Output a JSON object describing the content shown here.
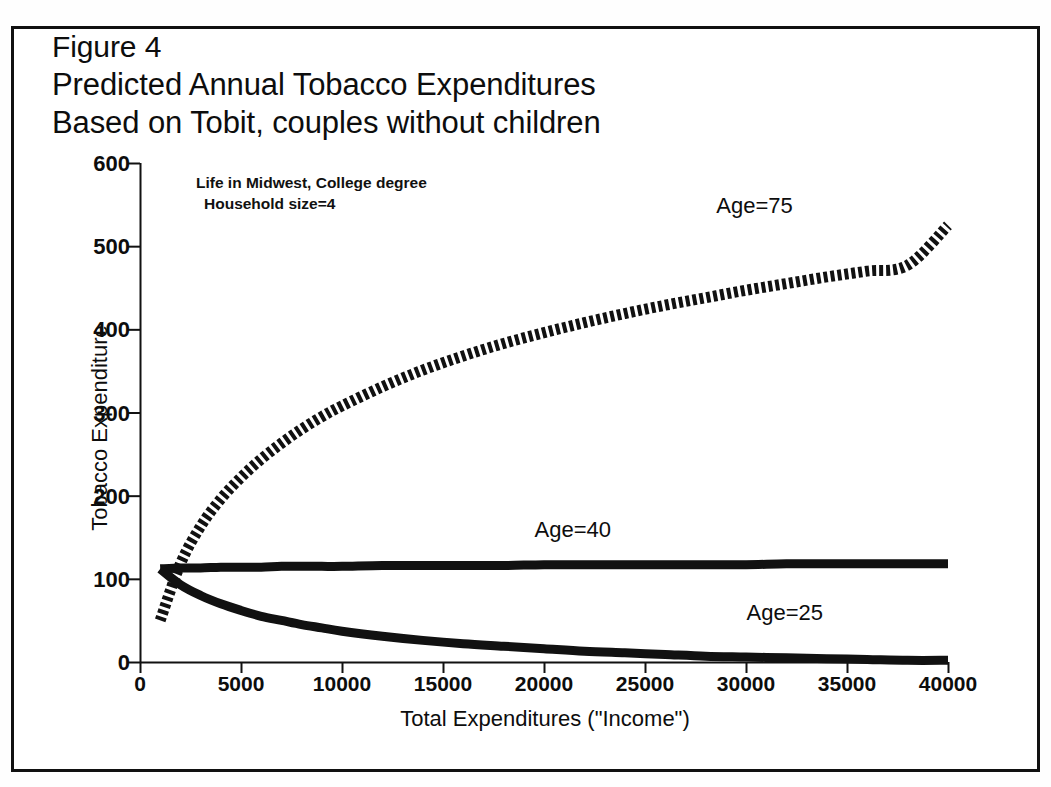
{
  "figure": {
    "title_lines": [
      "Figure 4",
      "Predicted Annual Tobacco Expenditures",
      "Based on Tobit, couples without children"
    ],
    "annotation_lines": [
      "Life in Midwest, College degree",
      "Household size=4"
    ]
  },
  "chart_data": {
    "type": "line",
    "title": "Predicted Annual Tobacco Expenditures Based on Tobit, couples without children",
    "subtitle": "Figure 4",
    "xlabel": "Total Expenditures (\"Income\")",
    "ylabel": "Tobacco Expenditure",
    "xlim": [
      0,
      40000
    ],
    "ylim": [
      0,
      600
    ],
    "xticks": [
      0,
      5000,
      10000,
      15000,
      20000,
      25000,
      30000,
      35000,
      40000
    ],
    "xtick_labels": [
      "0",
      "5000",
      "10000",
      "15000",
      "20000",
      "25000",
      "30000",
      "35000",
      "40000"
    ],
    "yticks": [
      0,
      100,
      200,
      300,
      400,
      500,
      600
    ],
    "ytick_labels": [
      "0",
      "100",
      "200",
      "300",
      "400",
      "500",
      "600"
    ],
    "grid": false,
    "legend_position": "inline-annotation",
    "annotations": [
      "Life in Midwest, College degree",
      "Household size=4"
    ],
    "x": [
      1000,
      2000,
      3000,
      4000,
      5000,
      6000,
      7000,
      8000,
      9000,
      10000,
      12000,
      14000,
      16000,
      18000,
      20000,
      22000,
      24000,
      26000,
      28000,
      30000,
      32000,
      34000,
      36000,
      38000,
      40000
    ],
    "series": [
      {
        "name": "Age=75",
        "label": "Age=75",
        "style": "dashed",
        "color": "#111111",
        "values": [
          50,
          118,
          163,
          196,
          222,
          244,
          263,
          280,
          295,
          308,
          331,
          351,
          368,
          383,
          396,
          408,
          419,
          429,
          438,
          447,
          455,
          463,
          470,
          477,
          525
        ]
      },
      {
        "name": "Age=40",
        "label": "Age=40",
        "style": "solid",
        "color": "#111111",
        "values": [
          112,
          113,
          113,
          114,
          114,
          114,
          115,
          115,
          115,
          115,
          116,
          116,
          116,
          116,
          117,
          117,
          117,
          117,
          117,
          117,
          118,
          118,
          118,
          118,
          118
        ]
      },
      {
        "name": "Age=25",
        "label": "Age=25",
        "style": "solid",
        "color": "#111111",
        "values": [
          112,
          93,
          80,
          70,
          62,
          55,
          50,
          45,
          41,
          37,
          31,
          26,
          22,
          19,
          16,
          13,
          11,
          9,
          7,
          6,
          5,
          4,
          3,
          2,
          2
        ]
      }
    ],
    "series_label_positions": [
      {
        "label": "Age=75",
        "x": 31500,
        "y": 545
      },
      {
        "label": "Age=40",
        "x": 22500,
        "y": 155
      },
      {
        "label": "Age=25",
        "x": 33000,
        "y": 55
      }
    ]
  }
}
